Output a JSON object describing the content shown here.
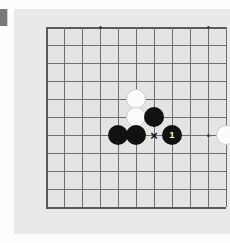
{
  "diagram": {
    "type": "go-board-problem",
    "game": "Go",
    "board": {
      "columns": 11,
      "rows": 11,
      "cell_size": 18,
      "board_color": "#e4e4e4",
      "line_color": "#6f6f6f",
      "edge_line_color": "#5a5a5a",
      "panel_color": "#e9e9e9",
      "page_background": "#fdfdfd",
      "edges_shown": [
        "left",
        "top",
        "bottom"
      ],
      "star_points": [
        {
          "col": 3,
          "row": 0
        },
        {
          "col": 9,
          "row": 0
        },
        {
          "col": 9,
          "row": 6
        }
      ]
    },
    "stones": [
      {
        "col": 5,
        "row": 4,
        "color": "white",
        "label": ""
      },
      {
        "col": 5,
        "row": 5,
        "color": "white",
        "label": ""
      },
      {
        "col": 6,
        "row": 5,
        "color": "black",
        "label": ""
      },
      {
        "col": 4,
        "row": 6,
        "color": "black",
        "label": ""
      },
      {
        "col": 5,
        "row": 6,
        "color": "black",
        "label": ""
      },
      {
        "col": 7,
        "row": 6,
        "color": "black",
        "label": "1"
      },
      {
        "col": 10,
        "row": 6,
        "color": "white",
        "label": ""
      }
    ],
    "marks": [
      {
        "col": 6,
        "row": 6,
        "glyph": "×",
        "name": "x-mark"
      }
    ],
    "colors": {
      "black_stone": "#111111",
      "white_stone": "#fbfbfb",
      "white_stone_border": "#cccccc",
      "black_label_text": "#ffffff",
      "mark_color": "#111111",
      "edge_marker": "#7a7a7a"
    }
  }
}
